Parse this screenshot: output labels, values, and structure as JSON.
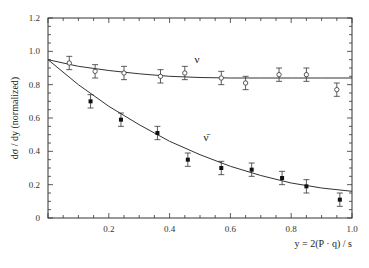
{
  "chart_data": {
    "type": "scatter",
    "title": "",
    "xlabel": "y = 2(P · q) / s",
    "ylabel": "dσ / dy   (normalized)",
    "xlim": [
      0,
      1.0
    ],
    "ylim": [
      0,
      1.2
    ],
    "x_ticks": [
      0.2,
      0.4,
      0.6,
      0.8,
      1.0
    ],
    "x_tick_labels": [
      "0.2",
      "0.4",
      "0.6",
      "0.8",
      "1.0"
    ],
    "y_ticks": [
      0,
      0.2,
      0.4,
      0.6,
      0.8,
      1.0,
      1.2
    ],
    "y_tick_labels": [
      "0",
      "0.2",
      "0.4",
      "0.6",
      "0.8",
      "1.0",
      "1.2"
    ],
    "grid": false,
    "legend": "none (inline annotations)",
    "series": [
      {
        "name": "ν",
        "marker": "open-circle",
        "x": [
          0.07,
          0.155,
          0.25,
          0.37,
          0.45,
          0.57,
          0.65,
          0.76,
          0.85,
          0.95
        ],
        "values": [
          0.93,
          0.88,
          0.87,
          0.85,
          0.87,
          0.84,
          0.81,
          0.86,
          0.86,
          0.77
        ],
        "errors": [
          0.04,
          0.04,
          0.04,
          0.04,
          0.04,
          0.04,
          0.04,
          0.04,
          0.04,
          0.04
        ]
      },
      {
        "name": "ν̄",
        "marker": "filled-circle",
        "x": [
          0.14,
          0.24,
          0.36,
          0.46,
          0.57,
          0.67,
          0.77,
          0.85,
          0.96
        ],
        "values": [
          0.7,
          0.59,
          0.51,
          0.35,
          0.3,
          0.29,
          0.24,
          0.19,
          0.11
        ],
        "errors": [
          0.04,
          0.04,
          0.04,
          0.04,
          0.04,
          0.04,
          0.04,
          0.04,
          0.04
        ]
      }
    ],
    "fit_curves": [
      {
        "name": "ν fit",
        "x": [
          0,
          0.1,
          0.2,
          0.3,
          0.4,
          0.5,
          0.6,
          0.7,
          0.8,
          0.9,
          1.0
        ],
        "values": [
          0.95,
          0.91,
          0.885,
          0.865,
          0.85,
          0.843,
          0.84,
          0.84,
          0.84,
          0.84,
          0.84
        ]
      },
      {
        "name": "ν̄ fit",
        "x": [
          0,
          0.1,
          0.2,
          0.3,
          0.4,
          0.5,
          0.6,
          0.7,
          0.8,
          0.9,
          1.0
        ],
        "values": [
          0.95,
          0.8,
          0.67,
          0.56,
          0.46,
          0.38,
          0.31,
          0.255,
          0.21,
          0.18,
          0.16
        ]
      }
    ],
    "annotations": [
      {
        "text": "ν",
        "x": 0.49,
        "y": 0.93
      },
      {
        "text": "ν̄",
        "x": 0.52,
        "y": 0.46
      }
    ]
  }
}
